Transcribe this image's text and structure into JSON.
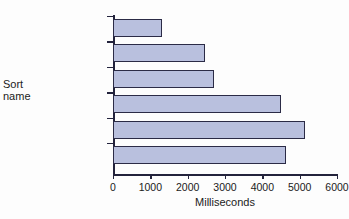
{
  "chart_data": {
    "type": "bar",
    "orientation": "horizontal",
    "title": "",
    "xlabel": "Milliseconds",
    "ylabel": "Sort\nname",
    "categories": [
      "Binary ins.",
      "Insertion",
      "Modified sel.",
      "Selection",
      "Flag bubble",
      "Bubble"
    ],
    "values": [
      1310,
      2470,
      2710,
      4500,
      5150,
      4640
    ],
    "xlim": [
      0,
      6000
    ],
    "xticks": [
      0,
      1000,
      2000,
      3000,
      4000,
      5000,
      6000
    ],
    "xtick_labels": [
      "0",
      "1000",
      "2000",
      "3000",
      "4000",
      "5000",
      "6000"
    ],
    "grid": false,
    "legend": null,
    "bar_fill_color": "#b9c0de",
    "bar_border_color": "#2b2b46",
    "axis_color": "#23233c",
    "background_color": "#fdfdfd"
  },
  "figure": {
    "clipped_title": "",
    "y_axis_title": "Sort\nname",
    "x_axis_title": "Milliseconds"
  }
}
